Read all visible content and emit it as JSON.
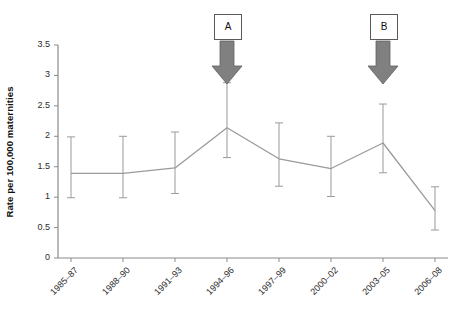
{
  "chart_data": {
    "type": "line",
    "title": "",
    "xlabel": "",
    "ylabel": "Rate per 100,000 maternities",
    "categories": [
      "1985–87",
      "1988–90",
      "1991–93",
      "1994–96",
      "1997–99",
      "2000–02",
      "2003–05",
      "2006–08"
    ],
    "values": [
      1.39,
      1.39,
      1.48,
      2.14,
      1.63,
      1.47,
      1.89,
      0.78
    ],
    "error_bars": {
      "lower": [
        0.99,
        0.99,
        1.06,
        1.65,
        1.18,
        1.01,
        1.4,
        0.46
      ],
      "upper": [
        1.99,
        2.0,
        2.07,
        2.88,
        2.22,
        2.0,
        2.53,
        1.17
      ]
    },
    "ylim": [
      0,
      3.5
    ],
    "yticks": [
      0,
      0.5,
      1,
      1.5,
      2,
      2.5,
      3,
      3.5
    ],
    "ytick_labels": [
      "0",
      "0.5",
      "1",
      "1.5",
      "2",
      "2.5",
      "3",
      "3.5"
    ],
    "grid": false,
    "legend": "none",
    "series_color": "#9a9a9a",
    "axis_color": "#8a8a8a",
    "annotations": [
      {
        "label": "A",
        "at_category": "1994–96"
      },
      {
        "label": "B",
        "at_category": "2003–05"
      }
    ],
    "annotation_arrow_color": "#808080"
  }
}
